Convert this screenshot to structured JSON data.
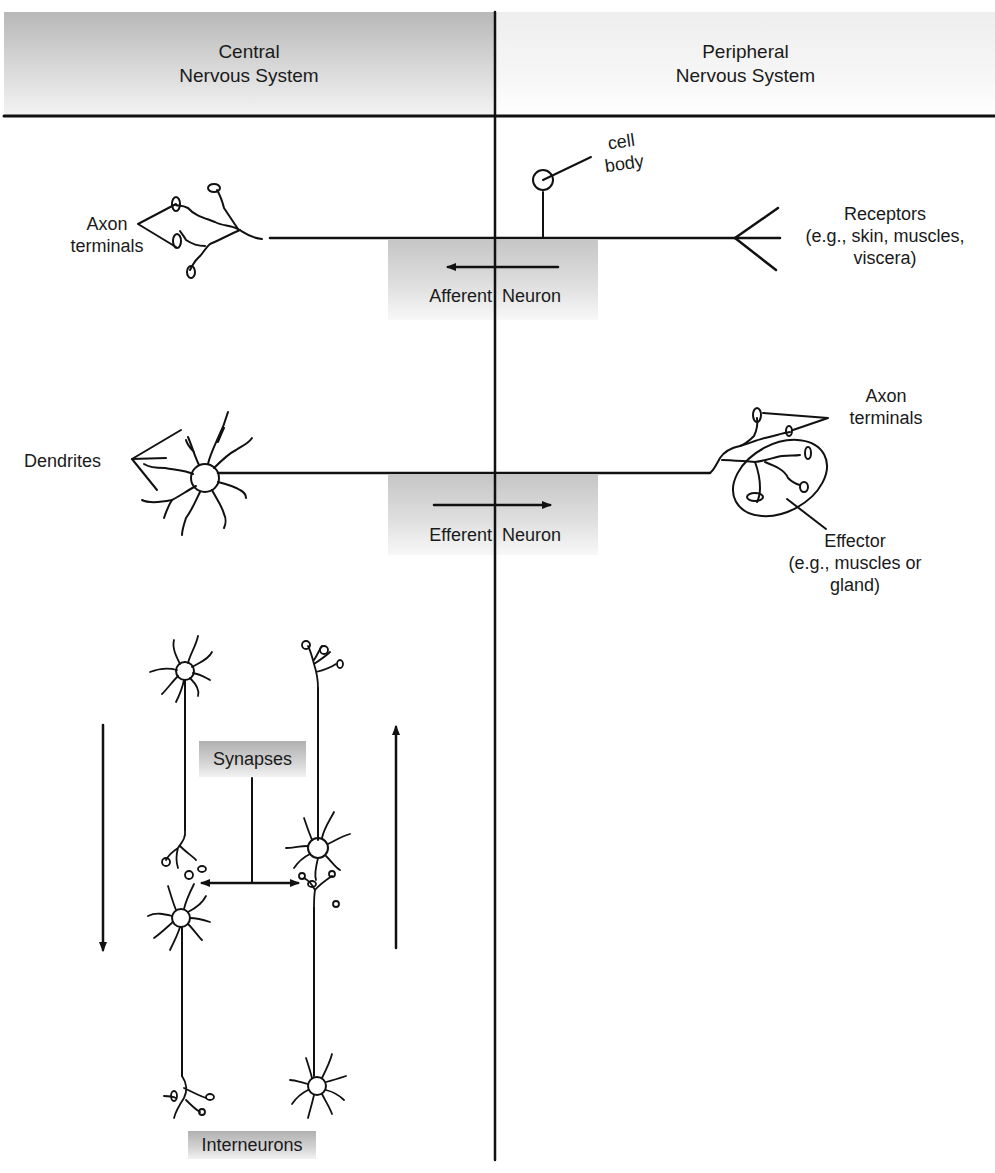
{
  "header": {
    "left": {
      "line1": "Central",
      "line2": "Nervous System"
    },
    "right": {
      "line1": "Peripheral",
      "line2": "Nervous System"
    }
  },
  "afferent": {
    "axon_terminals": {
      "line1": "Axon",
      "line2": "terminals"
    },
    "cell_body": {
      "line1": "cell",
      "line2": "body"
    },
    "receptors": {
      "line1": "Receptors",
      "line2": "(e.g., skin, muscles,",
      "line3": "viscera)"
    },
    "label_left": "Afferent",
    "label_right": "Neuron",
    "direction": "toward CNS"
  },
  "efferent": {
    "dendrites": "Dendrites",
    "axon_terminals": {
      "line1": "Axon",
      "line2": "terminals"
    },
    "effector": {
      "line1": "Effector",
      "line2": "(e.g., muscles or",
      "line3": "gland)"
    },
    "label_left": "Efferent",
    "label_right": "Neuron",
    "direction": "away from CNS"
  },
  "interneurons": {
    "synapses_label": "Synapses",
    "interneurons_label": "Interneurons",
    "left_arrow": "down",
    "right_arrow": "up"
  },
  "colors": {
    "line": "#111111",
    "shade_dark": "#b8b8b8",
    "shade_light": "#f4f4f4",
    "background": "#ffffff"
  }
}
